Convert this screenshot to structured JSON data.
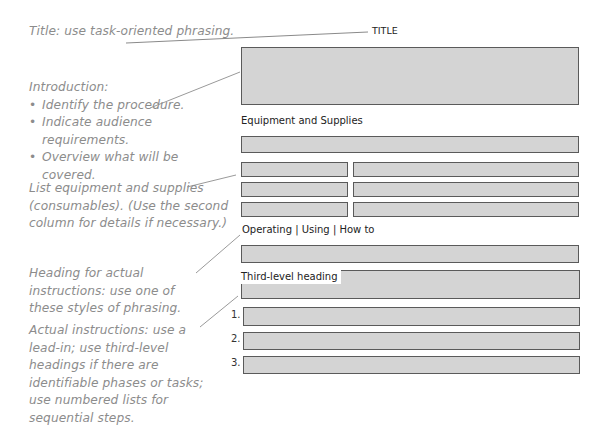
{
  "annotations": {
    "title_note": "Title: use task-oriented phrasing.",
    "intro_heading": "Introduction:",
    "intro_bullets": [
      "Identify the procedure.",
      "Indicate audience requirements.",
      "Overview what will be covered."
    ],
    "equipment_note": "List equipment and supplies (consumables). (Use the second column for details if necessary.)",
    "heading_note": "Heading for actual instructions: use one of these styles of phrasing.",
    "instructions_note": "Actual instructions: use a lead-in; use third-level headings if there are identifiable phases or tasks; use numbered lists for sequential steps."
  },
  "template": {
    "title_label": "TITLE",
    "equipment_heading": "Equipment and Supplies",
    "instructions_heading": "Operating | Using | How to",
    "third_level_heading": "Third-level heading",
    "step_numbers": [
      "1.",
      "2.",
      "3."
    ]
  },
  "colors": {
    "placeholder_fill": "#d4d4d4",
    "placeholder_border": "#5a5a5a",
    "annotation_text": "#8c8c8c",
    "leader_line": "#9a9a9a"
  }
}
